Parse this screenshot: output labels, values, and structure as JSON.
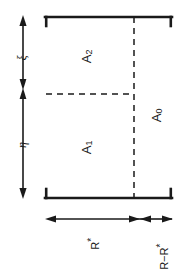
{
  "figure": {
    "type": "schematic-diagram",
    "orientation": "rotated-90-ccw",
    "background_color": "#ffffff",
    "line_color": "#1a1a1a",
    "regions": [
      {
        "id": "A0",
        "label": "A",
        "subscript": "0"
      },
      {
        "id": "A1",
        "label": "A",
        "subscript": "1"
      },
      {
        "id": "A2",
        "label": "A",
        "subscript": "2"
      }
    ],
    "axes": [
      {
        "id": "xi",
        "label": "ξ"
      },
      {
        "id": "eta",
        "label": "η"
      }
    ],
    "dimensions": [
      {
        "id": "R-star",
        "label": "R",
        "superscript": "*"
      },
      {
        "id": "R-minus-R-star",
        "label": "R−R",
        "superscript": "*"
      }
    ]
  }
}
